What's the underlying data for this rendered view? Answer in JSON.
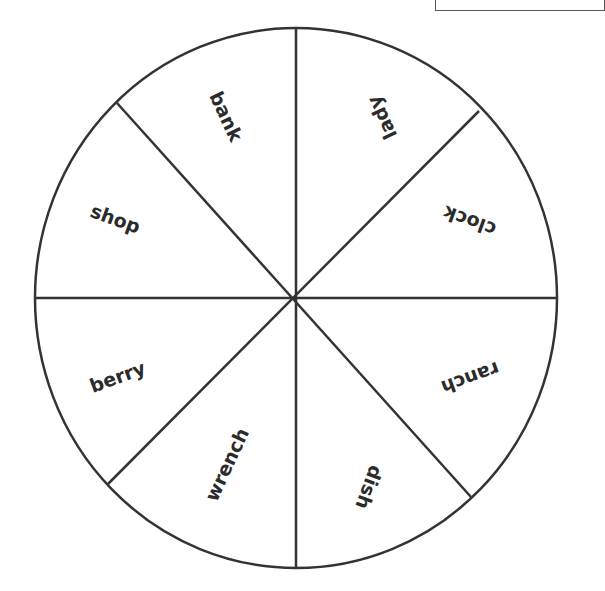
{
  "wheel": {
    "center": {
      "x": 296,
      "y": 298
    },
    "radius_x": 261,
    "radius_y": 270,
    "stroke_color": "#333333",
    "segments": 8,
    "words": [
      {
        "label": "bank",
        "x": 225,
        "y": 117,
        "rotate": 65
      },
      {
        "label": "lady",
        "x": 383,
        "y": 117,
        "rotate": 245
      },
      {
        "label": "clock",
        "x": 470,
        "y": 220,
        "rotate": 200
      },
      {
        "label": "ranch",
        "x": 470,
        "y": 377,
        "rotate": 160
      },
      {
        "label": "dish",
        "x": 368,
        "y": 487,
        "rotate": 110
      },
      {
        "label": "wrench",
        "x": 228,
        "y": 465,
        "rotate": -65
      },
      {
        "label": "berry",
        "x": 118,
        "y": 378,
        "rotate": -20
      },
      {
        "label": "shop",
        "x": 115,
        "y": 220,
        "rotate": 20
      }
    ]
  }
}
